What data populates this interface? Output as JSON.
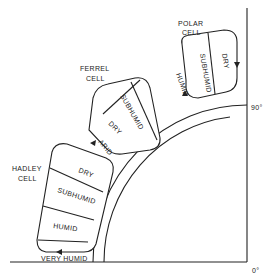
{
  "diagram": {
    "type": "atmospheric circulation cells over latitude quadrant",
    "axis": {
      "top_label": "90°",
      "bottom_label": "0°"
    },
    "cells": [
      {
        "name_line1": "POLAR",
        "name_line2": "CELL",
        "zones": [
          "SUBHUMID",
          "DRY"
        ],
        "edge_label": "HUMID"
      },
      {
        "name_line1": "FERREL",
        "name_line2": "CELL",
        "zones": [
          "SUBHUMID",
          "DRY"
        ],
        "edge_label": "ARID"
      },
      {
        "name_line1": "HADLEY",
        "name_line2": "CELL",
        "zones": [
          "DRY",
          "SUBHUMID",
          "HUMID"
        ],
        "edge_label": "VERY HUMID"
      }
    ],
    "colors": {
      "ink": "#222222",
      "background": "#ffffff"
    }
  }
}
